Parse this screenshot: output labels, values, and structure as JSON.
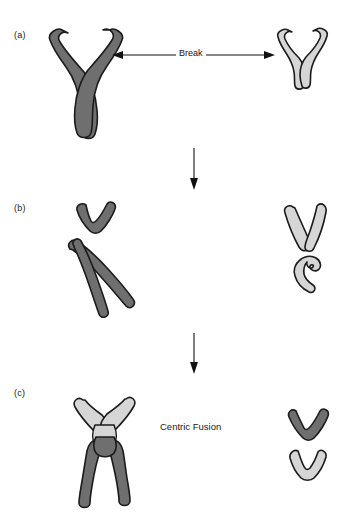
{
  "figure": {
    "background_color": "#ffffff",
    "width": 343,
    "height": 519
  },
  "colors": {
    "chromosome_dark": "#6f6f6f",
    "chromosome_light": "#d6d6d6",
    "outline": "#1b1b1b",
    "text": "#1a1a1a",
    "arrow": "#111111"
  },
  "panels": [
    {
      "id": "a",
      "label": "(a)",
      "description": "Two intact metacentric chromosomes before breakage",
      "shapes": [
        {
          "name": "dark-chromosome-intact",
          "shade": "dark"
        },
        {
          "name": "light-chromosome-intact",
          "shade": "light"
        }
      ]
    },
    {
      "id": "b",
      "label": "(b)",
      "description": "Chromosomes broken into short-arm and long-arm fragments",
      "shapes": [
        {
          "name": "dark-short-arm-fragment",
          "shade": "dark"
        },
        {
          "name": "dark-long-arm-fragment",
          "shade": "dark"
        },
        {
          "name": "light-long-arm-fragment",
          "shade": "light"
        },
        {
          "name": "light-short-arm-fragment",
          "shade": "light"
        }
      ]
    },
    {
      "id": "c",
      "label": "(c)",
      "description": "Long arms fused at the centromere; short-arm fragments remain separate",
      "shapes": [
        {
          "name": "fused-chromosome",
          "shade": "dark-and-light"
        },
        {
          "name": "dark-short-arm-leftover",
          "shade": "dark"
        },
        {
          "name": "light-short-arm-leftover",
          "shade": "light"
        }
      ]
    }
  ],
  "annotations": {
    "break_label": "Break",
    "centric_fusion_label": "Centric Fusion"
  },
  "arrows": [
    {
      "name": "break-arrow",
      "direction": "double-horizontal",
      "label": "Break"
    },
    {
      "name": "step-arrow-a-to-b",
      "direction": "down",
      "label": ""
    },
    {
      "name": "step-arrow-b-to-c",
      "direction": "down",
      "label": ""
    }
  ]
}
